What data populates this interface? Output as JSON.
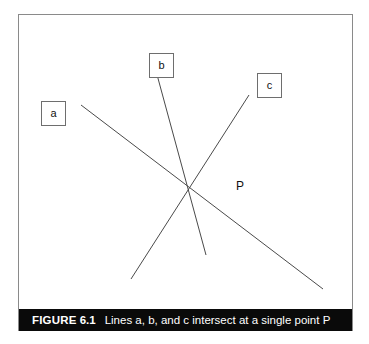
{
  "figure": {
    "labels": [
      {
        "id": "a",
        "text": "a"
      },
      {
        "id": "b",
        "text": "b"
      },
      {
        "id": "c",
        "text": "c"
      }
    ],
    "point_label": "P",
    "caption": {
      "prefix": "FIGURE",
      "number": "6.1",
      "text": "Lines a, b, and c intersect at a single point P"
    },
    "colors": {
      "frame": "#8a8a8a",
      "line": "#4a4a4a",
      "label_box_border": "#6e6e6e",
      "caption_bar": "#0a0a0a",
      "caption_text": "#ffffff",
      "background": "#ffffff"
    }
  },
  "chart_data": {
    "type": "diagram",
    "title": "Lines a, b, and c intersect at a single point P",
    "intersection_point": {
      "label": "P",
      "x": 168,
      "y": 172
    },
    "lines": [
      {
        "name": "a",
        "x1": 62,
        "y1": 90,
        "x2": 304,
        "y2": 274
      },
      {
        "name": "b",
        "x1": 137,
        "y1": 56,
        "x2": 187,
        "y2": 240
      },
      {
        "name": "c",
        "x1": 230,
        "y1": 80,
        "x2": 112,
        "y2": 264
      }
    ],
    "label_positions": [
      {
        "name": "a",
        "x": 22,
        "y": 86
      },
      {
        "name": "b",
        "x": 130,
        "y": 38
      },
      {
        "name": "c",
        "x": 238,
        "y": 58
      }
    ],
    "grid": false,
    "legend": "none"
  }
}
